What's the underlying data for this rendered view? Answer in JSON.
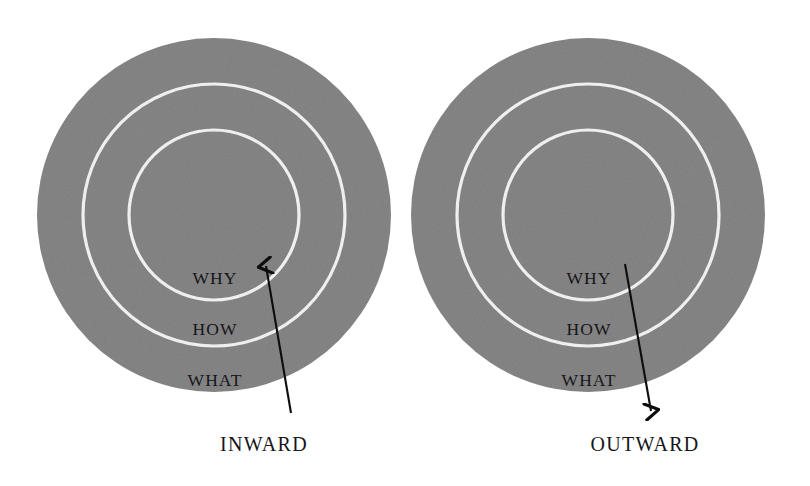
{
  "figure": {
    "type": "concentric-circles-diagram",
    "background_color": "#ffffff",
    "circle_fill_color": "#878787",
    "ring_line_color": "#f7f7f5",
    "arrow_color": "#0d0d0d",
    "text_color": "#16161a"
  },
  "panels": [
    {
      "id": "inward",
      "caption": "INWARD",
      "arrow_direction": "up",
      "arrow": {
        "tail_x": 291,
        "tail_y": 413,
        "head_x": 265,
        "head_y": 261
      },
      "caption_x": 264,
      "caption_y": 451,
      "circle": {
        "cx": 214,
        "cy": 215,
        "r_outer": 177,
        "r_middle": 131,
        "r_inner": 85
      },
      "ring_labels": [
        {
          "text": "WHY",
          "x": 215,
          "y": 284
        },
        {
          "text": "HOW",
          "x": 215,
          "y": 335
        },
        {
          "text": "WHAT",
          "x": 215,
          "y": 386
        }
      ]
    },
    {
      "id": "outward",
      "caption": "OUTWARD",
      "arrow_direction": "down",
      "arrow": {
        "tail_x": 625,
        "tail_y": 264,
        "head_x": 652,
        "head_y": 416
      },
      "caption_x": 645,
      "caption_y": 451,
      "circle": {
        "cx": 588,
        "cy": 215,
        "r_outer": 177,
        "r_middle": 131,
        "r_inner": 85
      },
      "ring_labels": [
        {
          "text": "WHY",
          "x": 589,
          "y": 284
        },
        {
          "text": "HOW",
          "x": 589,
          "y": 335
        },
        {
          "text": "WHAT",
          "x": 589,
          "y": 386
        }
      ]
    }
  ]
}
